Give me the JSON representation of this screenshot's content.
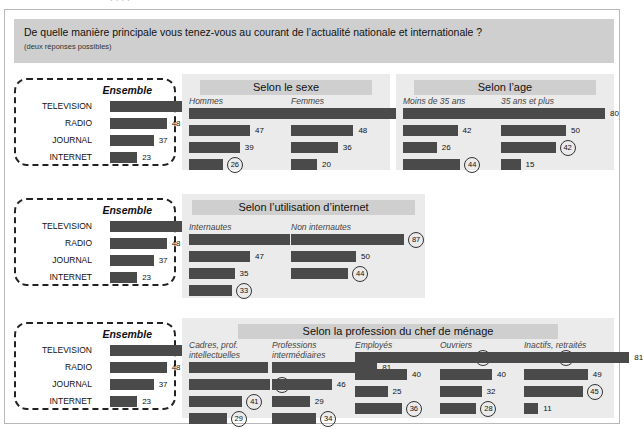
{
  "top_cut_text": "· · · ·",
  "question": {
    "main": "De quelle manière principale vous tenez-vous au courant de l’actualité nationale et internationale ?",
    "sub": "(deux réponses possibles)"
  },
  "colors": {
    "bar": "#4a4a4a",
    "panel": "#ebebeb",
    "title_band": "#cfcfcf",
    "banner": "#cfcfcf",
    "frame_border": "#b9b9b9",
    "dashed_border": "#222222"
  },
  "ensemble": {
    "title": "Ensemble",
    "labels": [
      "TELEVISION",
      "RADIO",
      "JOURNAL",
      "INTERNET"
    ],
    "values": [
      80,
      48,
      37,
      23
    ]
  },
  "sections": [
    {
      "title": "Selon le sexe",
      "groups": [
        {
          "name": "Hommes",
          "values": [
            80,
            47,
            39,
            26
          ],
          "circled": [
            false,
            false,
            false,
            true
          ]
        },
        {
          "name": "Femmes",
          "values": [
            81,
            48,
            36,
            20
          ],
          "circled": [
            false,
            false,
            false,
            false
          ]
        }
      ]
    },
    {
      "title": "Selon l’age",
      "groups": [
        {
          "name": "Moins de 35 ans",
          "values": [
            82,
            42,
            26,
            44
          ],
          "circled": [
            false,
            false,
            false,
            true
          ]
        },
        {
          "name": "35 ans et plus",
          "values": [
            80,
            50,
            42,
            15
          ],
          "circled": [
            false,
            false,
            true,
            false
          ]
        }
      ]
    },
    {
      "title": "Selon l’utilisation d’internet",
      "groups": [
        {
          "name": "Internautes",
          "values": [
            78,
            47,
            35,
            33
          ],
          "circled": [
            false,
            false,
            false,
            true
          ]
        },
        {
          "name": "Non internautes",
          "values": [
            87,
            50,
            44
          ],
          "circled": [
            true,
            false,
            true
          ]
        }
      ]
    },
    {
      "title": "Selon la profession du chef de ménage",
      "groups": [
        {
          "name": "Cadres, prof. intellectuelles",
          "values": [
            61,
            62,
            41,
            29
          ],
          "circled": [
            false,
            true,
            true,
            true
          ]
        },
        {
          "name": "Professions intermédiaires",
          "values": [
            81,
            46,
            29,
            34
          ],
          "circled": [
            false,
            false,
            false,
            true
          ]
        },
        {
          "name": "Employés",
          "values": [
            89,
            40,
            25,
            36
          ],
          "circled": [
            true,
            false,
            false,
            true
          ]
        },
        {
          "name": "Ouvriers",
          "values": [
            88,
            40,
            32,
            28
          ],
          "circled": [
            true,
            false,
            false,
            true
          ]
        },
        {
          "name": "Inactifs, retraités",
          "values": [
            81,
            49,
            45,
            11
          ],
          "circled": [
            false,
            false,
            true,
            false
          ]
        }
      ]
    }
  ],
  "chart_data": {
    "type": "bar",
    "title": "De quelle manière principale vous tenez-vous au courant de l’actualité nationale et internationale ?",
    "subtitle": "(deux réponses possibles)",
    "categories": [
      "TELEVISION",
      "RADIO",
      "JOURNAL",
      "INTERNET"
    ],
    "xlabel": "",
    "ylabel": "",
    "xlim": [
      0,
      100
    ],
    "grid": false,
    "legend": "none",
    "unit": "%",
    "series": [
      {
        "name": "Ensemble",
        "values": [
          80,
          48,
          37,
          23
        ]
      },
      {
        "name": "Hommes",
        "values": [
          80,
          47,
          39,
          26
        ]
      },
      {
        "name": "Femmes",
        "values": [
          81,
          48,
          36,
          20
        ]
      },
      {
        "name": "Moins de 35 ans",
        "values": [
          82,
          42,
          26,
          44
        ]
      },
      {
        "name": "35 ans et plus",
        "values": [
          80,
          50,
          42,
          15
        ]
      },
      {
        "name": "Internautes",
        "values": [
          78,
          47,
          35,
          33
        ]
      },
      {
        "name": "Non internautes",
        "values": [
          87,
          50,
          44,
          null
        ]
      },
      {
        "name": "Cadres, prof. intellectuelles",
        "values": [
          61,
          62,
          41,
          29
        ]
      },
      {
        "name": "Professions intermédiaires",
        "values": [
          81,
          46,
          29,
          34
        ]
      },
      {
        "name": "Employés",
        "values": [
          89,
          40,
          25,
          36
        ]
      },
      {
        "name": "Ouvriers",
        "values": [
          88,
          40,
          32,
          28
        ]
      },
      {
        "name": "Inactifs, retraités",
        "values": [
          81,
          49,
          45,
          11
        ]
      }
    ],
    "highlighted_values": [
      26,
      44,
      42,
      33,
      87,
      44,
      62,
      41,
      29,
      34,
      89,
      36,
      88,
      28,
      45
    ]
  }
}
